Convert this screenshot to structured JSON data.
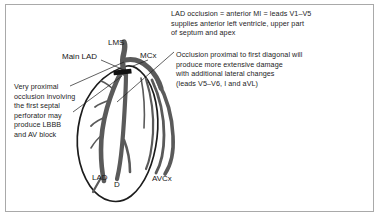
{
  "figure": {
    "background_color": "#ffffff",
    "border_color": "#a9a9a9",
    "vessel_color": "#5a5a5a",
    "outline_color": "#1a1a1a",
    "occlusion_marker_color": "#111111"
  },
  "notes": {
    "top": "LAD occlusion = anterior MI = leads V1–V5\nsupplies anterior left ventricle, upper part\nof septum and apex",
    "right": "Occlusion proximal to first diagonal will\nproduce more extensive damage\nwith additional lateral changes\n(leads V5–V6, I and aVL)",
    "left": "Very proximal\nocclusion involving\nthe first septal\nperforator may\nproduce LBBB\nand AV block"
  },
  "labels": {
    "lms": "LMS",
    "main_lad": "Main LAD",
    "mcx": "MCx",
    "lad": "LAD",
    "diagonal": "D",
    "avcx": "AVCx"
  },
  "annotations": {
    "occlusion_marker": "occlusion-bar",
    "leader_left": "leader-line-left",
    "leader_right": "leader-line-right",
    "leader_main_lad": "leader-line-main-lad",
    "leader_mcx": "leader-line-mcx"
  }
}
